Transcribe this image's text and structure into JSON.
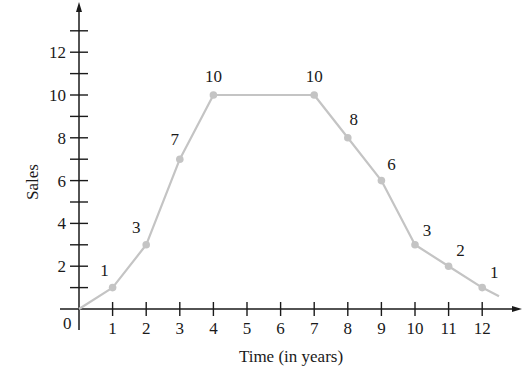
{
  "chart_data": {
    "type": "line",
    "title": "",
    "xlabel": "Time (in years)",
    "ylabel": "Sales",
    "origin_label": "0",
    "x": [
      0,
      1,
      2,
      3,
      4,
      7,
      8,
      9,
      10,
      11,
      12
    ],
    "series": [
      {
        "name": "Sales",
        "values": [
          0,
          1,
          3,
          7,
          10,
          10,
          8,
          6,
          3,
          2,
          1
        ],
        "marked_points": [
          {
            "x": 1,
            "y": 1,
            "label": "1"
          },
          {
            "x": 2,
            "y": 3,
            "label": "3"
          },
          {
            "x": 3,
            "y": 7,
            "label": "7"
          },
          {
            "x": 4,
            "y": 10,
            "label": "10"
          },
          {
            "x": 7,
            "y": 10,
            "label": "10"
          },
          {
            "x": 8,
            "y": 8,
            "label": "8"
          },
          {
            "x": 9,
            "y": 6,
            "label": "6"
          },
          {
            "x": 10,
            "y": 3,
            "label": "3"
          },
          {
            "x": 11,
            "y": 2,
            "label": "2"
          },
          {
            "x": 12,
            "y": 1,
            "label": "1"
          }
        ],
        "line_end": {
          "x": 12.5,
          "y": 0.6
        },
        "color": "#c4c4c4"
      }
    ],
    "xticks": [
      1,
      2,
      3,
      4,
      5,
      6,
      7,
      8,
      9,
      10,
      11,
      12
    ],
    "xtick_labels": [
      "1",
      "2",
      "3",
      "4",
      "5",
      "6",
      "7",
      "8",
      "9",
      "10",
      "11",
      "12"
    ],
    "yticks": [
      1,
      2,
      3,
      4,
      5,
      6,
      7,
      8,
      9,
      10,
      11,
      12,
      13
    ],
    "ytick_labels": [
      {
        "value": 2,
        "label": "2"
      },
      {
        "value": 4,
        "label": "4"
      },
      {
        "value": 6,
        "label": "6"
      },
      {
        "value": 8,
        "label": "8"
      },
      {
        "value": 10,
        "label": "10"
      },
      {
        "value": 12,
        "label": "12"
      }
    ],
    "xlim": [
      0,
      13
    ],
    "ylim": [
      0,
      14
    ],
    "grid": false,
    "legend": null,
    "axis_color": "#1a1a1a",
    "line_color": "#c4c4c4",
    "marker_color": "#c4c4c4"
  }
}
